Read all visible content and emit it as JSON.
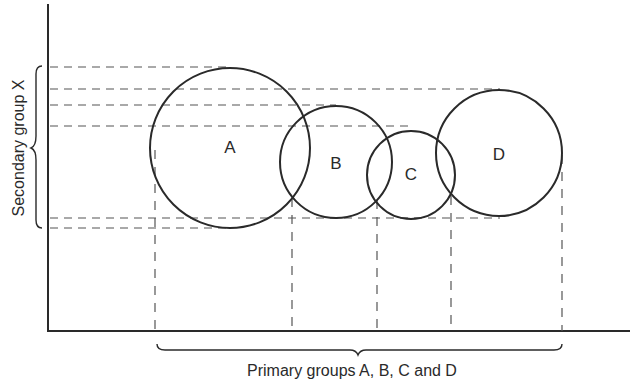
{
  "diagram": {
    "y_axis_label": "Secondary group X",
    "x_axis_label": "Primary groups A, B, C and D",
    "circles": [
      {
        "label": "A",
        "cx": 230,
        "cy": 148,
        "r": 80
      },
      {
        "label": "B",
        "cx": 336,
        "cy": 162,
        "r": 56
      },
      {
        "label": "C",
        "cx": 411,
        "cy": 175,
        "r": 44
      },
      {
        "label": "D",
        "cx": 499,
        "cy": 153,
        "r": 63
      }
    ],
    "colors": {
      "stroke": "#2a2a2a",
      "dash": "#555555",
      "background": "#ffffff"
    }
  }
}
